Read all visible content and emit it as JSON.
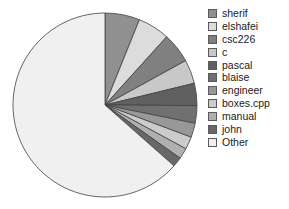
{
  "chart_data": {
    "type": "pie",
    "title": "",
    "labels": [
      "sherif",
      "elshafei",
      "csc226",
      "c",
      "pascal",
      "blaise",
      "engineer",
      "boxes.cpp",
      "manual",
      "john",
      "Other"
    ],
    "values": [
      6.1,
      5.6,
      5.3,
      4.2,
      3.9,
      3.1,
      2.5,
      2.2,
      1.9,
      1.7,
      63.5
    ],
    "colors": [
      "#909090",
      "#dcdcdc",
      "#808080",
      "#c8c8c8",
      "#606060",
      "#707070",
      "#989898",
      "#cccccc",
      "#b0b0b0",
      "#686868",
      "#f0f0f0"
    ],
    "start_angle": 0,
    "direction": "clockwise",
    "legend_position": "right",
    "grid": false,
    "edge_color": "#404040",
    "xlabel": "",
    "ylabel": ""
  },
  "legend": {
    "entries": [
      {
        "label": "sherif",
        "color": "#909090"
      },
      {
        "label": "elshafei",
        "color": "#dcdcdc"
      },
      {
        "label": "csc226",
        "color": "#808080"
      },
      {
        "label": "c",
        "color": "#c8c8c8"
      },
      {
        "label": "pascal",
        "color": "#606060"
      },
      {
        "label": "blaise",
        "color": "#707070"
      },
      {
        "label": "engineer",
        "color": "#989898"
      },
      {
        "label": "boxes.cpp",
        "color": "#cccccc"
      },
      {
        "label": "manual",
        "color": "#b0b0b0"
      },
      {
        "label": "john",
        "color": "#686868"
      },
      {
        "label": "Other",
        "color": "#f0f0f0"
      }
    ]
  },
  "figure": {
    "background": "#ffffff",
    "center_x": 105,
    "center_y": 105,
    "radius": 92
  }
}
